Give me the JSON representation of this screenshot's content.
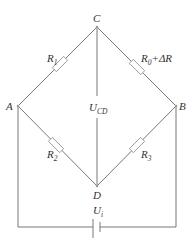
{
  "diagram": {
    "type": "wheatstone-bridge",
    "nodes": {
      "C": {
        "label": "C",
        "x": 97,
        "y": 27
      },
      "A": {
        "label": "A",
        "x": 18,
        "y": 106
      },
      "B": {
        "label": "B",
        "x": 176,
        "y": 106
      },
      "D": {
        "label": "D",
        "x": 97,
        "y": 186
      }
    },
    "resistors": [
      {
        "id": "R1",
        "main": "R",
        "sub": "1",
        "between": [
          "A",
          "C"
        ]
      },
      {
        "id": "R0dR",
        "main": "R",
        "sub": "0",
        "suffix": "+ΔR",
        "between": [
          "C",
          "B"
        ]
      },
      {
        "id": "R2",
        "main": "R",
        "sub": "2",
        "between": [
          "A",
          "D"
        ]
      },
      {
        "id": "R3",
        "main": "R",
        "sub": "3",
        "between": [
          "D",
          "B"
        ]
      }
    ],
    "output_voltage": {
      "main": "U",
      "sub": "CD"
    },
    "source_voltage": {
      "main": "U",
      "sub": "i"
    },
    "colors": {
      "wire": "#6a6a6a",
      "resistor_outline": "#8a8a8a",
      "text": "#333333"
    }
  }
}
